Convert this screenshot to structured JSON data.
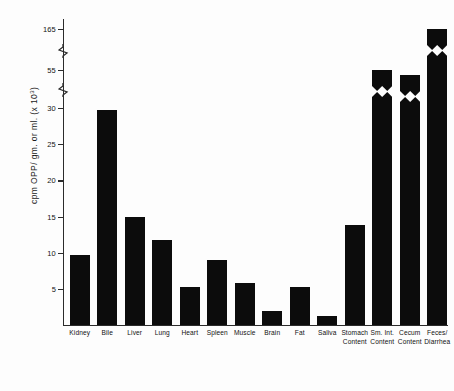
{
  "chart_data": {
    "type": "bar",
    "title": "",
    "xlabel": "",
    "ylabel": "cpm OPP/ gm. or ml. (x 10³)",
    "ylabel_main": "cpm OPP/ gm. or ml. (x 10",
    "ylabel_exp": "3",
    "ylabel_tail": ")",
    "grid": false,
    "legend": "none",
    "axis_broken": true,
    "ylim": [
      0,
      165
    ],
    "tick_labels": [
      "5",
      "10",
      "15",
      "20",
      "25",
      "30",
      "55",
      "165"
    ],
    "tick_values": [
      5,
      10,
      15,
      20,
      25,
      30,
      55,
      165
    ],
    "break_segments": [
      {
        "from": 30,
        "to": 55
      },
      {
        "from": 55,
        "to": 165
      }
    ],
    "categories": [
      "Kidney",
      "Bile",
      "Liver",
      "Lung",
      "Heart",
      "Spleen",
      "Muscle",
      "Brain",
      "Fat",
      "Saliva",
      "Stomach Content",
      "Sm. Int. Content",
      "Cecum Content",
      "Feces/ Diarrhea"
    ],
    "category_lines": [
      [
        "Kidney",
        ""
      ],
      [
        "Bile",
        ""
      ],
      [
        "Liver",
        ""
      ],
      [
        "Lung",
        ""
      ],
      [
        "Heart",
        ""
      ],
      [
        "Spleen",
        ""
      ],
      [
        "Muscle",
        ""
      ],
      [
        "Brain",
        ""
      ],
      [
        "Fat",
        ""
      ],
      [
        "Saliva",
        ""
      ],
      [
        "Stomach",
        "Content"
      ],
      [
        "Sm. Int.",
        "Content"
      ],
      [
        "Cecum",
        "Content"
      ],
      [
        "Feces/",
        "Diarrhea"
      ]
    ],
    "values": [
      9.7,
      29.7,
      15.0,
      11.7,
      5.2,
      9.0,
      5.8,
      2.0,
      5.2,
      1.2,
      13.8,
      55.0,
      52.0,
      165.0
    ],
    "broken_bars": [
      11,
      12,
      13
    ],
    "bar_color": "#0c0c0c"
  },
  "figure": {
    "background": "#fdfdfd",
    "axis_color": "#2b2b2b"
  }
}
